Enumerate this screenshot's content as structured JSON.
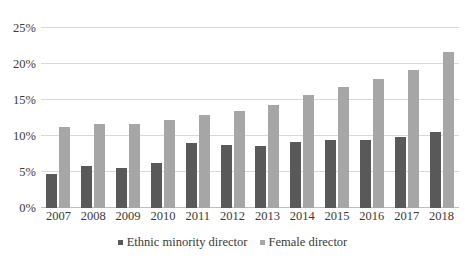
{
  "chart_data": {
    "type": "bar",
    "title": "",
    "subtitle": "",
    "xlabel": "",
    "ylabel": "",
    "ylim": [
      0,
      25
    ],
    "yticks": [
      0,
      5,
      10,
      15,
      20,
      25
    ],
    "ytick_labels": [
      "0%",
      "5%",
      "10%",
      "15%",
      "20%",
      "25%"
    ],
    "grid": true,
    "legend_position": "bottom",
    "categories": [
      "2007",
      "2008",
      "2009",
      "2010",
      "2011",
      "2012",
      "2013",
      "2014",
      "2015",
      "2016",
      "2017",
      "2018"
    ],
    "series": [
      {
        "name": "Ethnic minority director",
        "color": "#595959",
        "values": [
          4.7,
          5.9,
          5.6,
          6.2,
          9.0,
          8.8,
          8.6,
          9.1,
          9.4,
          9.4,
          9.8,
          10.6
        ]
      },
      {
        "name": "Female director",
        "color": "#a6a6a6",
        "values": [
          11.2,
          11.7,
          11.7,
          12.2,
          12.9,
          13.5,
          14.3,
          15.7,
          16.8,
          17.9,
          19.2,
          21.6
        ]
      }
    ]
  },
  "legend": {
    "entries": [
      {
        "label": "Ethnic minority director"
      },
      {
        "label": "Female director"
      }
    ]
  }
}
